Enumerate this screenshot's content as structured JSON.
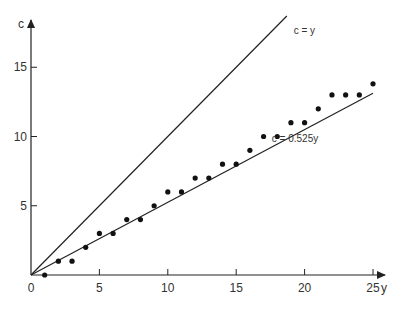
{
  "chart_data": {
    "type": "scatter",
    "title": "",
    "xlabel": "y",
    "ylabel": "c",
    "xlim": [
      0,
      26
    ],
    "ylim": [
      0,
      18.5
    ],
    "x_ticks": [
      0,
      5,
      10,
      15,
      20,
      25
    ],
    "y_ticks": [
      5,
      10,
      15
    ],
    "x_tick_labels": [
      "0",
      "5",
      "10",
      "15",
      "20",
      "25"
    ],
    "y_tick_labels": [
      "5",
      "10",
      "15"
    ],
    "grid": false,
    "legend": null,
    "series": [
      {
        "name": "observed",
        "kind": "points",
        "x": [
          1,
          2,
          3,
          4,
          5,
          6,
          7,
          8,
          9,
          10,
          11,
          12,
          13,
          14,
          15,
          16,
          17,
          18,
          19,
          20,
          21,
          22,
          23,
          24,
          25
        ],
        "y": [
          0,
          1,
          1,
          2,
          3,
          3,
          4,
          4,
          5,
          6,
          6,
          7,
          7,
          8,
          8,
          9,
          10,
          10,
          11,
          11,
          12,
          13,
          13,
          13,
          13.8
        ]
      },
      {
        "name": "c = y",
        "kind": "line",
        "x": [
          0,
          18.7
        ],
        "y": [
          0,
          18.7
        ]
      },
      {
        "name": "c = 0.525y",
        "kind": "line",
        "x": [
          0,
          25
        ],
        "y": [
          0,
          13.125
        ]
      }
    ],
    "annotations": [
      {
        "text": "c = y",
        "x": 19.2,
        "y": 17.4
      },
      {
        "text": "c = 0.525y",
        "x": 17.6,
        "y": 9.6
      }
    ]
  },
  "labels": {
    "x_axis": "y",
    "y_axis": "c",
    "line1": "c = y",
    "line2": "c = 0.525y",
    "origin": "0"
  }
}
